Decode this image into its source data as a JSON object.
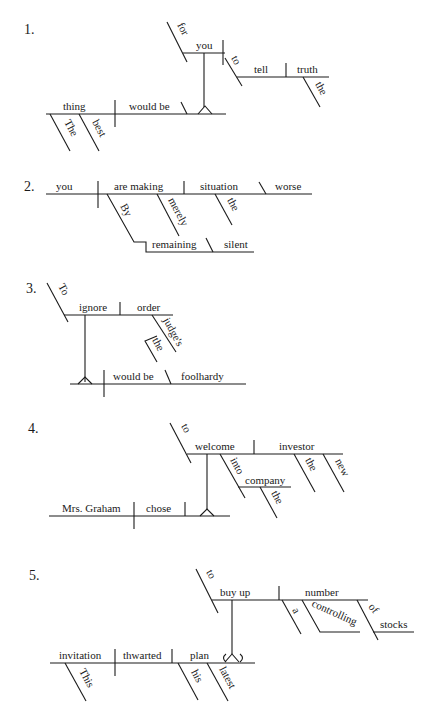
{
  "diagrams": [
    {
      "number": "1.",
      "words": {
        "subject": "thing",
        "subject_mod_1": "The",
        "subject_mod_2": "best",
        "verb": "would be",
        "inf_subject": "you",
        "inf_subject_prep": "for",
        "inf_marker": "to",
        "inf_verb": "tell",
        "inf_object": "truth",
        "inf_object_mod": "the"
      }
    },
    {
      "number": "2.",
      "words": {
        "subject": "you",
        "verb": "are making",
        "object": "situation",
        "complement": "worse",
        "object_mod": "the",
        "adverb": "merely",
        "prep": "By",
        "gerund": "remaining",
        "gerund_complement": "silent"
      }
    },
    {
      "number": "3.",
      "words": {
        "inf_marker": "To",
        "inf_verb": "ignore",
        "inf_object": "order",
        "possessive": "judge's",
        "possessive_mod": "the",
        "verb": "would be",
        "complement": "foolhardy"
      }
    },
    {
      "number": "4.",
      "words": {
        "subject": "Mrs. Graham",
        "verb": "chose",
        "inf_marker": "to",
        "inf_verb": "welcome",
        "inf_object": "investor",
        "object_mod_1": "the",
        "object_mod_2": "new",
        "prep": "into",
        "prep_object": "company",
        "prep_object_mod": "the"
      }
    },
    {
      "number": "5.",
      "words": {
        "subject": "invitation",
        "subject_mod": "This",
        "verb": "thwarted",
        "object": "plan",
        "object_mod_1": "his",
        "object_mod_2": "latest",
        "inf_marker": "to",
        "inf_verb": "buy up",
        "inf_object": "number",
        "inf_object_mod_1": "a",
        "inf_object_mod_2": "controlling",
        "prep": "of",
        "prep_object": "stocks"
      }
    }
  ]
}
